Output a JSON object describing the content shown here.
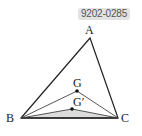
{
  "badge": {
    "text": "9202-0285"
  },
  "figure": {
    "labels": {
      "A": "A",
      "B": "B",
      "C": "C",
      "G": "G",
      "G_prime": "G′"
    },
    "colors": {
      "stroke": "#222222",
      "shaded": "#dcdcdc",
      "badge_bg": "#e2e2e2"
    }
  }
}
